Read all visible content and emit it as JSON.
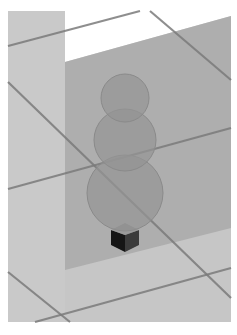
{
  "scene": {
    "description": "3D render: three stacked translucent spheres (snowman) with dark base block on a gridded plane",
    "colors": {
      "frame": "#ffffff",
      "floor": "#c6c6c6",
      "floor_left": "#cbcbcb",
      "sky": "#ffffff",
      "plane": "#a9a9a9",
      "sphere": "#9a9a9a",
      "sphere_stroke": "#8a8a8a",
      "grid": "#7c7c7c",
      "block_dark": "#1e1e1e",
      "block_side": "#3a3a3a"
    },
    "spheres": [
      {
        "cx": 125,
        "cy": 98,
        "r": 24
      },
      {
        "cx": 125,
        "cy": 140,
        "r": 31
      },
      {
        "cx": 125,
        "cy": 193,
        "r": 38
      }
    ]
  }
}
